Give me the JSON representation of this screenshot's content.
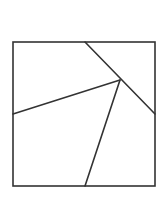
{
  "diagram": {
    "type": "geometric-dissection",
    "stroke_color": "#333333",
    "stroke_width": 1.6,
    "background": "#ffffff",
    "square": {
      "x": 13,
      "y": 42,
      "width": 142,
      "height": 144
    },
    "interior_point": {
      "x": 120,
      "y": 80
    },
    "segments": [
      {
        "name": "top-to-right-diagonal",
        "x1": 85,
        "y1": 42,
        "x2": 155,
        "y2": 114
      },
      {
        "name": "left-edge-to-interior",
        "x1": 13,
        "y1": 114,
        "x2": 120,
        "y2": 80
      },
      {
        "name": "interior-to-bottom-edge",
        "x1": 120,
        "y1": 80,
        "x2": 85,
        "y2": 186
      }
    ]
  }
}
